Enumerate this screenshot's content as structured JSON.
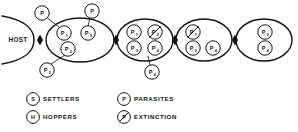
{
  "figure": {
    "host": {
      "label": "HOST"
    },
    "connectors": [
      {
        "name": "host-to-stage-1"
      },
      {
        "name": "stage-1-to-stage-2"
      },
      {
        "name": "stage-2-to-stage-3"
      },
      {
        "name": "stage-3-to-stage-4"
      }
    ],
    "stages": [
      {
        "name": "stage-1",
        "cx": 80,
        "cy": 40,
        "rx": 34,
        "ry": 22,
        "nodes": [
          {
            "id": "s1-p1",
            "letter": "P",
            "sub": "1",
            "x": 64,
            "y": 33,
            "r": 7.2,
            "extinct": false
          },
          {
            "id": "s1-p3",
            "letter": "P",
            "sub": "3",
            "x": 88,
            "y": 33,
            "r": 7.2,
            "extinct": false
          },
          {
            "id": "s1-p2",
            "letter": "P",
            "sub": "2",
            "x": 68,
            "y": 49,
            "r": 7.2,
            "extinct": false
          }
        ],
        "satellites": [
          {
            "id": "sat-s1-p",
            "letter": "P",
            "sub": "",
            "x": 42,
            "y": 13,
            "r": 7.2,
            "extinct": false,
            "leader": {
              "x1": 47.5,
              "y1": 18,
              "x2": 59,
              "y2": 27
            }
          },
          {
            "id": "sat-s1-p-top-right",
            "letter": "P",
            "sub": "",
            "x": 92,
            "y": 11,
            "r": 7.2,
            "extinct": false,
            "leader": {
              "x1": 90,
              "y1": 18,
              "x2": 88,
              "y2": 26
            }
          },
          {
            "id": "sat-s1-p2-below",
            "letter": "P",
            "sub": "2",
            "x": 47,
            "y": 70,
            "r": 7.2,
            "extinct": false,
            "leader": {
              "x1": 51,
              "y1": 64,
              "x2": 65,
              "y2": 55
            }
          }
        ]
      },
      {
        "name": "stage-2",
        "cx": 145,
        "cy": 40,
        "rx": 28,
        "ry": 21,
        "nodes": [
          {
            "id": "s2-p1",
            "letter": "P",
            "sub": "1",
            "x": 134,
            "y": 32,
            "r": 7.2,
            "extinct": false
          },
          {
            "id": "s2-p2",
            "letter": "P",
            "sub": "2",
            "x": 155,
            "y": 32,
            "r": 7.2,
            "extinct": true
          },
          {
            "id": "s2-p3",
            "letter": "P",
            "sub": "3",
            "x": 134,
            "y": 48,
            "r": 7.2,
            "extinct": false
          },
          {
            "id": "s2-p4",
            "letter": "P",
            "sub": "4",
            "x": 155,
            "y": 48,
            "r": 7.2,
            "extinct": false
          }
        ],
        "satellites": [
          {
            "id": "sat-s2-p4",
            "letter": "P",
            "sub": "4",
            "x": 152,
            "y": 72,
            "r": 7.2,
            "extinct": false,
            "leader": {
              "x1": 150,
              "y1": 65,
              "x2": 148,
              "y2": 56
            }
          }
        ]
      },
      {
        "name": "stage-3",
        "cx": 204,
        "cy": 40,
        "rx": 28,
        "ry": 21,
        "nodes": [
          {
            "id": "s3-p1",
            "letter": "P",
            "sub": "1",
            "x": 193,
            "y": 32,
            "r": 7.2,
            "extinct": true
          },
          {
            "id": "s3-p3",
            "letter": "P",
            "sub": "3",
            "x": 193,
            "y": 48,
            "r": 7.2,
            "extinct": false
          },
          {
            "id": "s3-p4",
            "letter": "P",
            "sub": "4",
            "x": 213,
            "y": 48,
            "r": 7.2,
            "extinct": false
          }
        ],
        "satellites": []
      },
      {
        "name": "stage-4",
        "cx": 264,
        "cy": 40,
        "rx": 28,
        "ry": 21,
        "nodes": [
          {
            "id": "s4-p3",
            "letter": "P",
            "sub": "3",
            "x": 265,
            "y": 32,
            "r": 7.2,
            "extinct": false
          },
          {
            "id": "s4-p4",
            "letter": "P",
            "sub": "4",
            "x": 265,
            "y": 48,
            "r": 7.2,
            "extinct": false
          }
        ],
        "satellites": []
      }
    ]
  },
  "legend": {
    "items": [
      {
        "id": "legend-settlers",
        "glyph": "S",
        "sub": "",
        "label": "SETTLERS",
        "extinct": false,
        "gx": 33,
        "gy": 99,
        "tx": 43
      },
      {
        "id": "legend-hoppers",
        "glyph": "H",
        "sub": "",
        "label": "HOPPERS",
        "extinct": false,
        "gx": 33,
        "gy": 117,
        "tx": 43
      },
      {
        "id": "legend-parasites",
        "glyph": "P",
        "sub": "",
        "label": "PARASITES",
        "extinct": false,
        "gx": 124,
        "gy": 99,
        "tx": 134
      },
      {
        "id": "legend-extinction",
        "glyph": "P",
        "sub": "",
        "label": "EXTINCTION",
        "extinct": true,
        "gx": 124,
        "gy": 117,
        "tx": 134
      }
    ]
  },
  "colors": {
    "ink": "#141414",
    "paper": "#ffffff"
  }
}
